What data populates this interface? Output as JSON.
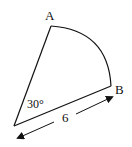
{
  "diagram": {
    "type": "circular-sector",
    "points": {
      "center": {
        "x": 14,
        "y": 126
      },
      "A": {
        "x": 51,
        "y": 26,
        "label": "A"
      },
      "B": {
        "x": 111,
        "y": 86,
        "label": "B"
      }
    },
    "angle_label": "30°",
    "radius_label": "6",
    "colors": {
      "stroke": "#111111",
      "background": "#ffffff"
    }
  }
}
